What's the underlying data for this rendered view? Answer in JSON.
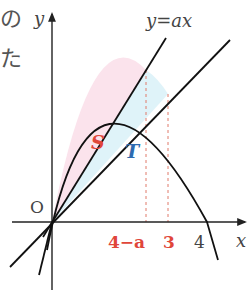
{
  "diagram": {
    "top_left_text": [
      "の",
      "た"
    ],
    "axis_y_label": "y",
    "axis_x_label": "x",
    "origin_label": "O",
    "line_label": "y=ax",
    "region_s_label": "S",
    "region_t_label": "T",
    "tick_4_minus_a": "4−a",
    "tick_3": "3",
    "tick_4": "4",
    "colors": {
      "s_fill": "#fbe3ec",
      "t_fill": "#dff3f9",
      "red": "#e0463a",
      "blue": "#2e6bb0"
    }
  }
}
